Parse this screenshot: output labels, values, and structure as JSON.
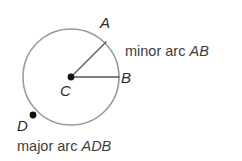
{
  "figure": {
    "name": "circle-arcs-diagram",
    "background_color": "#ffffff",
    "circle": {
      "center_label": "C",
      "center_x": 71,
      "center_y": 77,
      "radius": 48,
      "stroke_color": "#9a9a9a",
      "stroke_width": 1.6
    },
    "points": [
      {
        "id": "A",
        "label": "A",
        "x": 106,
        "y": 42,
        "on_circle": true,
        "dot": false
      },
      {
        "id": "B",
        "label": "B",
        "x": 119,
        "y": 77,
        "on_circle": true,
        "dot": false
      },
      {
        "id": "C",
        "label": "C",
        "x": 71,
        "y": 77,
        "on_circle": false,
        "dot": true
      },
      {
        "id": "D",
        "label": "D",
        "x": 33,
        "y": 115,
        "on_circle": true,
        "dot": true
      }
    ],
    "radii": [
      {
        "from": "C",
        "to": "A",
        "stroke_color": "#555555"
      },
      {
        "from": "C",
        "to": "B",
        "stroke_color": "#555555"
      }
    ],
    "captions": {
      "minor": {
        "prefix": "minor arc ",
        "arc": "AB"
      },
      "major": {
        "prefix": "major arc ",
        "arc": "ADB"
      }
    },
    "colors": {
      "point_label": "#2b2b2b",
      "caption": "#3d3d3d",
      "line": "#555555",
      "circle": "#9a9a9a",
      "dot": "#111111"
    }
  }
}
